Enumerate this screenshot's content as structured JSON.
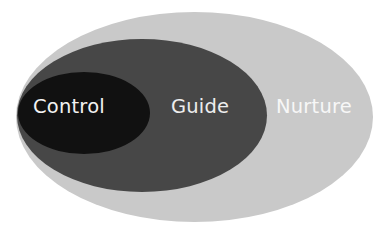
{
  "diagram": {
    "type": "nested-ellipses",
    "layers": [
      {
        "name": "outer",
        "label": "Nurture",
        "fill": "#c9c9c9",
        "text_color": "#f7f7f7"
      },
      {
        "name": "middle",
        "label": "Guide",
        "fill": "#474747",
        "text_color": "#ededed"
      },
      {
        "name": "inner",
        "label": "Control",
        "fill": "#111111",
        "text_color": "#f2f2f2"
      }
    ]
  }
}
